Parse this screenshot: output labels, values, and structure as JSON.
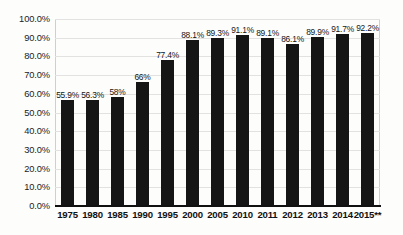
{
  "chart_data": {
    "type": "bar",
    "title": "",
    "subtitle": "",
    "xlabel": "",
    "ylabel": "",
    "ylim": [
      0,
      100
    ],
    "grid": true,
    "legend": "none",
    "categories": [
      "1975",
      "1980",
      "1985",
      "1990",
      "1995",
      "2000",
      "2005",
      "2010",
      "2011",
      "2012",
      "2013",
      "2014",
      "2015**"
    ],
    "values": [
      55.9,
      56.3,
      58,
      66,
      77.4,
      88.1,
      89.3,
      91.1,
      89.1,
      86.1,
      89.9,
      91.7,
      92.2
    ],
    "data_labels": [
      "55.9%",
      "56.3%",
      "58%",
      "66%",
      "77.4%",
      "88.1%",
      "89.3%",
      "91.1%",
      "89.1%",
      "86.1%",
      "89.9%",
      "91.7%",
      "92.2%"
    ],
    "y_ticks": [
      "0.0%",
      "10.0%",
      "20.0%",
      "30.0%",
      "40.0%",
      "50.0%",
      "60.0%",
      "70.0%",
      "80.0%",
      "90.0%",
      "100.0%"
    ],
    "y_tick_values": [
      0,
      10,
      20,
      30,
      40,
      50,
      60,
      70,
      80,
      90,
      100
    ],
    "bar_color": "#151515",
    "gridline_color": "#e2e2e0",
    "axis_color": "#111111",
    "background_color": "#fdfdfc"
  }
}
